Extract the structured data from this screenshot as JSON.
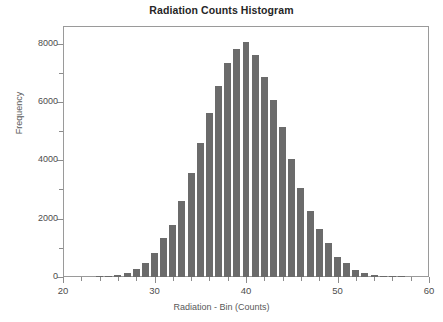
{
  "chart_data": {
    "type": "bar",
    "title": "Radiation Counts Histogram",
    "subtitle": "",
    "xlabel": "Radiation - Bin (Counts)",
    "ylabel": "Frequency",
    "xlim": [
      20,
      60
    ],
    "ylim": [
      0,
      8600
    ],
    "grid": false,
    "legend": null,
    "bar_color": "#6b6b6b",
    "axis_color": "#9a9a9a",
    "x_ticks": [
      20,
      30,
      40,
      50,
      60
    ],
    "x_tick_labels": [
      "20",
      "30",
      "40",
      "50",
      "60"
    ],
    "x_minor_tick_step": 2,
    "y_ticks": [
      0,
      2000,
      4000,
      6000,
      8000
    ],
    "y_tick_labels": [
      "0",
      "2000",
      "4000",
      "6000",
      "8000"
    ],
    "y_minor_tick_step": 1000,
    "bin_width": 1,
    "categories": [
      24,
      25,
      26,
      27,
      28,
      29,
      30,
      31,
      32,
      33,
      34,
      35,
      36,
      37,
      38,
      39,
      40,
      41,
      42,
      43,
      44,
      45,
      46,
      47,
      48,
      49,
      50,
      51,
      52,
      53,
      54,
      55,
      56,
      57
    ],
    "values": [
      10,
      20,
      60,
      130,
      290,
      490,
      820,
      1330,
      1790,
      2610,
      3560,
      4590,
      5620,
      6560,
      7330,
      7800,
      8050,
      7590,
      6860,
      6080,
      5150,
      4040,
      3060,
      2250,
      1640,
      1150,
      700,
      490,
      240,
      130,
      60,
      25,
      15,
      10
    ]
  },
  "axes": {
    "x_title": "Radiation - Bin (Counts)",
    "y_title": "Frequency"
  },
  "title": "Radiation Counts Histogram"
}
